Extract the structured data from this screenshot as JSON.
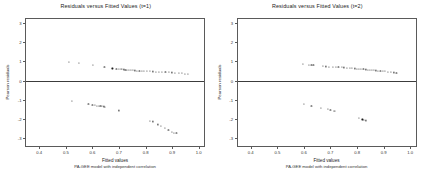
{
  "figure": {
    "width": 423,
    "height": 176,
    "background": "#ffffff",
    "ink_color": "#1d1d1d"
  },
  "chart_data": [
    {
      "type": "scatter",
      "panel_id": "t1",
      "title": "Residuals versus Fitted Values (t=1)",
      "xlabel": "Fitted values",
      "sublabel": "PA-GEE model with independent correlation",
      "ylabel": "Pearson residuals",
      "xlim": [
        0.35,
        1.02
      ],
      "ylim": [
        -3.4,
        3.2
      ],
      "xticks": [
        0.4,
        0.5,
        0.6,
        0.7,
        0.8,
        0.9,
        1.0
      ],
      "xticklabels": [
        "0.4",
        "0.5",
        "0.6",
        "0.7",
        "0.8",
        "0.9",
        "1.0"
      ],
      "yticks": [
        -3,
        -2,
        -1,
        0,
        1,
        2,
        3
      ],
      "yticklabels": [
        "-3",
        "-2",
        "-1",
        "0",
        "1",
        "2",
        "3"
      ],
      "grid": false,
      "legend": "none",
      "reference_line": {
        "type": "horizontal",
        "y": 0,
        "color": "#3c3c3c"
      },
      "points": [
        [
          0.513,
          0.95
        ],
        [
          0.548,
          0.91
        ],
        [
          0.603,
          0.83
        ],
        [
          0.645,
          0.7
        ],
        [
          0.675,
          0.63
        ],
        [
          0.69,
          0.62
        ],
        [
          0.7,
          0.6
        ],
        [
          0.706,
          0.6
        ],
        [
          0.712,
          0.59
        ],
        [
          0.718,
          0.58
        ],
        [
          0.724,
          0.57
        ],
        [
          0.73,
          0.57
        ],
        [
          0.737,
          0.56
        ],
        [
          0.744,
          0.55
        ],
        [
          0.752,
          0.54
        ],
        [
          0.76,
          0.53
        ],
        [
          0.768,
          0.52
        ],
        [
          0.777,
          0.52
        ],
        [
          0.786,
          0.51
        ],
        [
          0.795,
          0.5
        ],
        [
          0.805,
          0.5
        ],
        [
          0.816,
          0.49
        ],
        [
          0.827,
          0.48
        ],
        [
          0.838,
          0.47
        ],
        [
          0.85,
          0.46
        ],
        [
          0.862,
          0.45
        ],
        [
          0.875,
          0.44
        ],
        [
          0.888,
          0.43
        ],
        [
          0.9,
          0.42
        ],
        [
          0.912,
          0.41
        ],
        [
          0.925,
          0.39
        ],
        [
          0.937,
          0.38
        ],
        [
          0.948,
          0.36
        ],
        [
          0.958,
          0.35
        ],
        [
          0.523,
          -1.06
        ],
        [
          0.585,
          -1.22
        ],
        [
          0.6,
          -1.25
        ],
        [
          0.61,
          -1.27
        ],
        [
          0.618,
          -1.3
        ],
        [
          0.624,
          -1.31
        ],
        [
          0.63,
          -1.32
        ],
        [
          0.636,
          -1.33
        ],
        [
          0.642,
          -1.34
        ],
        [
          0.648,
          -1.35
        ],
        [
          0.7,
          -1.55
        ],
        [
          0.815,
          -2.08
        ],
        [
          0.828,
          -2.12
        ],
        [
          0.848,
          -2.28
        ],
        [
          0.858,
          -2.34
        ],
        [
          0.872,
          -2.45
        ],
        [
          0.886,
          -2.58
        ],
        [
          0.898,
          -2.66
        ],
        [
          0.908,
          -2.72
        ],
        [
          0.916,
          -2.74
        ]
      ]
    },
    {
      "type": "scatter",
      "panel_id": "t2",
      "title": "Residuals versus Fitted Values (t=2)",
      "xlabel": "Fitted values",
      "sublabel": "PA-GEE model with independent correlation",
      "ylabel": "Pearson residuals",
      "xlim": [
        0.35,
        1.02
      ],
      "ylim": [
        -3.4,
        3.2
      ],
      "xticks": [
        0.4,
        0.5,
        0.6,
        0.7,
        0.8,
        0.9,
        1.0
      ],
      "xticklabels": [
        "0.4",
        "0.5",
        "0.6",
        "0.7",
        "0.8",
        "0.9",
        "1.0"
      ],
      "yticks": [
        -3,
        -2,
        -1,
        0,
        1,
        2,
        3
      ],
      "yticklabels": [
        "-3",
        "-2",
        "-1",
        "0",
        "1",
        "2",
        "3"
      ],
      "grid": false,
      "legend": "none",
      "reference_line": {
        "type": "horizontal",
        "y": 0,
        "color": "#3c3c3c"
      },
      "points": [
        [
          0.595,
          0.88
        ],
        [
          0.62,
          0.82
        ],
        [
          0.628,
          0.81
        ],
        [
          0.636,
          0.8
        ],
        [
          0.672,
          0.75
        ],
        [
          0.682,
          0.74
        ],
        [
          0.695,
          0.73
        ],
        [
          0.708,
          0.72
        ],
        [
          0.72,
          0.71
        ],
        [
          0.73,
          0.7
        ],
        [
          0.742,
          0.69
        ],
        [
          0.752,
          0.68
        ],
        [
          0.762,
          0.67
        ],
        [
          0.772,
          0.66
        ],
        [
          0.782,
          0.64
        ],
        [
          0.792,
          0.63
        ],
        [
          0.8,
          0.62
        ],
        [
          0.808,
          0.61
        ],
        [
          0.816,
          0.6
        ],
        [
          0.824,
          0.59
        ],
        [
          0.832,
          0.58
        ],
        [
          0.84,
          0.57
        ],
        [
          0.848,
          0.56
        ],
        [
          0.856,
          0.55
        ],
        [
          0.864,
          0.54
        ],
        [
          0.872,
          0.53
        ],
        [
          0.88,
          0.52
        ],
        [
          0.888,
          0.51
        ],
        [
          0.896,
          0.5
        ],
        [
          0.904,
          0.49
        ],
        [
          0.915,
          0.47
        ],
        [
          0.928,
          0.44
        ],
        [
          0.938,
          0.42
        ],
        [
          0.948,
          0.4
        ],
        [
          0.6,
          -1.22
        ],
        [
          0.628,
          -1.3
        ],
        [
          0.665,
          -1.42
        ],
        [
          0.69,
          -1.48
        ],
        [
          0.7,
          -1.52
        ],
        [
          0.712,
          -1.56
        ],
        [
          0.718,
          -1.58
        ],
        [
          0.808,
          -1.95
        ],
        [
          0.82,
          -2.02
        ],
        [
          0.826,
          -2.05
        ],
        [
          0.832,
          -2.07
        ]
      ]
    }
  ]
}
